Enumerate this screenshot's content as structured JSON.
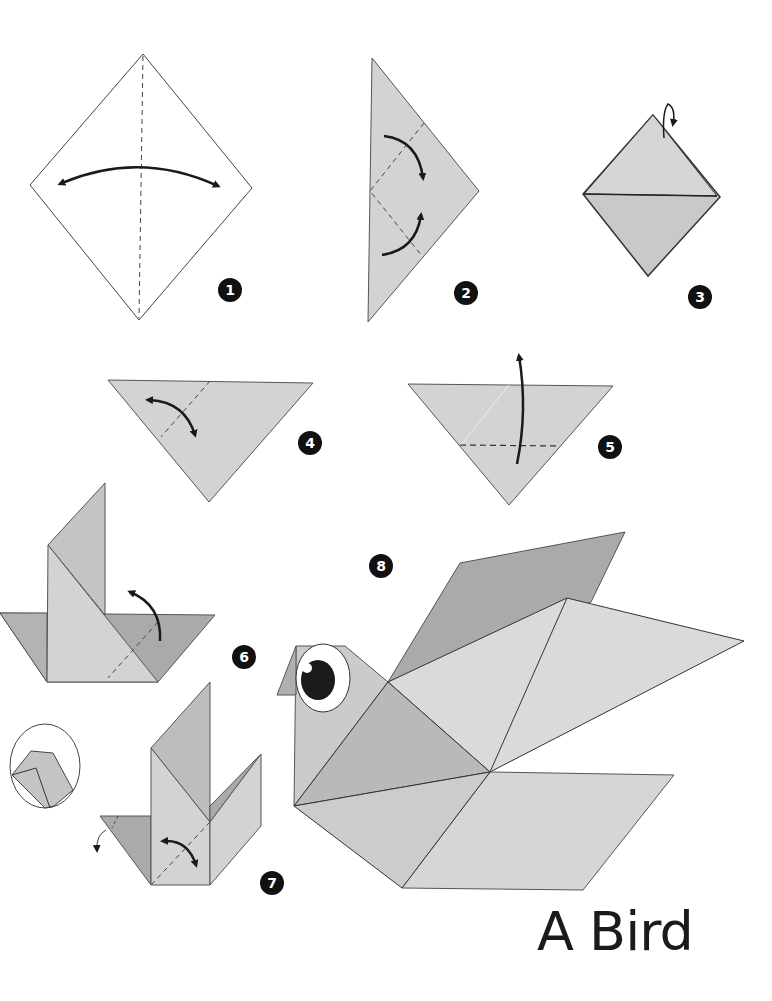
{
  "title": "A Bird",
  "colors": {
    "paper_light": "#d3d3d3",
    "paper_mid": "#c4c4c4",
    "paper_dark": "#a9a9a9",
    "outline": "#3a3a3a",
    "badge": "#111111",
    "background": "#ffffff"
  },
  "steps": [
    {
      "number": "1",
      "description": "square diamond with vertical center crease and two-way arrow"
    },
    {
      "number": "2",
      "description": "triangle with two folds toward the right tip"
    },
    {
      "number": "3",
      "description": "diamond with horizontal center line and fold-back arrow at top"
    },
    {
      "number": "4",
      "description": "inverted triangle with diagonal dashed crease and two-way arrow"
    },
    {
      "number": "5",
      "description": "inverted triangle with horizontal dashed fold and upward arrow"
    },
    {
      "number": "6",
      "description": "base with raised flap and upward fold arrow"
    },
    {
      "number": "7",
      "description": "bird form with reverse fold detail and inset circle"
    },
    {
      "number": "8",
      "description": "finished origami bird with eye and wings"
    }
  ]
}
